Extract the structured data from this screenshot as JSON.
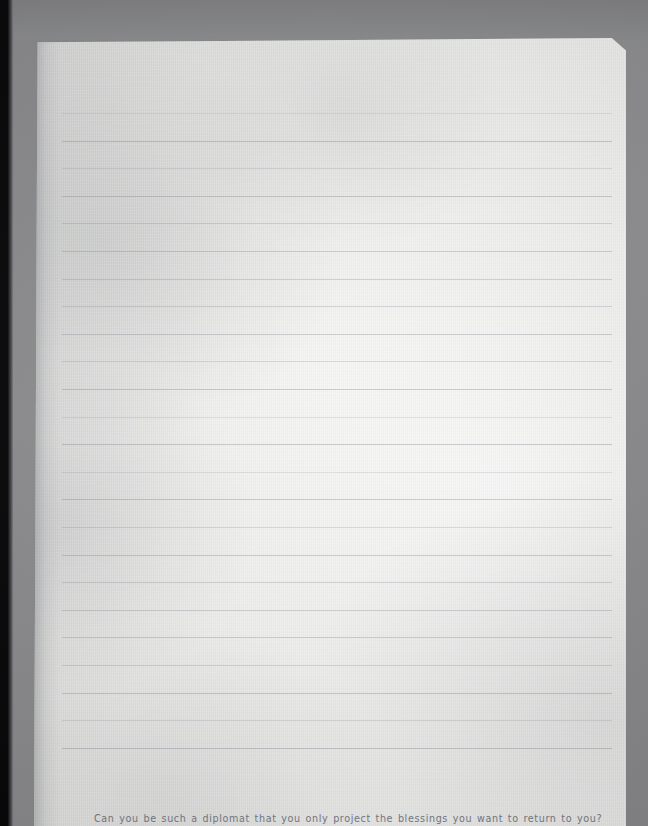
{
  "document": {
    "kind": "scanned-ruled-notebook-page",
    "background_color": "#8b8b8d",
    "paper_color": "#f1f1ef",
    "edge_strip_color": "#060607",
    "ruled_line_color": "#7e848c",
    "text_color": "#6b7079",
    "prompt_text": "Can you be such a diplomat that you only project the blessings you want to return to you?",
    "ruled_lines": {
      "count": 24,
      "first_line_y": 113,
      "spacing": 27.6,
      "left_x": 62,
      "right_x": 612
    }
  }
}
